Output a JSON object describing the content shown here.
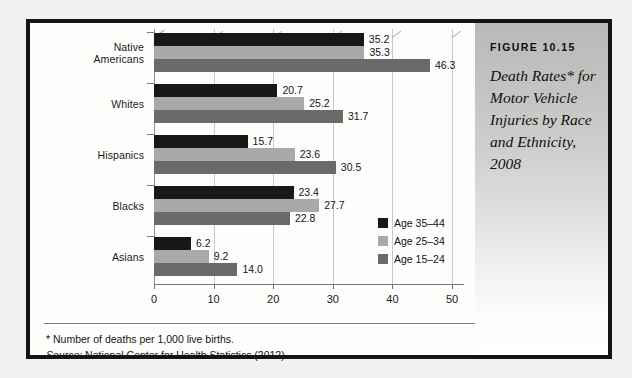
{
  "caption": {
    "figure_number": "FIGURE 10.15",
    "title": "Death Rates* for Motor Vehicle Injuries by Race and Ethnicity, 2008"
  },
  "footnote": {
    "asterisk_note": "*  Number of deaths per 1,000 live births.",
    "source_label": "Source:",
    "source_text": " National Center for Health Statistics (2012)."
  },
  "colors": {
    "series_35_44": "#181818",
    "series_25_34": "#a9a9a9",
    "series_15_24": "#6a6a6a",
    "frame": "#151515",
    "gridline": "#c9c9c9"
  },
  "chart_data": {
    "type": "bar",
    "orientation": "horizontal",
    "title": "Death Rates* for Motor Vehicle Injuries by Race and Ethnicity, 2008",
    "xlabel": "",
    "ylabel": "",
    "xlim": [
      0,
      52
    ],
    "xticks": [
      0,
      10,
      20,
      30,
      40,
      50
    ],
    "xtick_labels": [
      "0",
      "10",
      "20",
      "30",
      "40",
      "50"
    ],
    "grid": true,
    "legend_position": "center-right",
    "categories": [
      "Native Americans",
      "Whites",
      "Hispanics",
      "Blacks",
      "Asians"
    ],
    "category_lines": [
      [
        "Native",
        "Americans"
      ],
      [
        "Whites"
      ],
      [
        "Hispanics"
      ],
      [
        "Blacks"
      ],
      [
        "Asians"
      ]
    ],
    "series": [
      {
        "name": "Age 35–44",
        "color": "#181818",
        "values": [
          35.2,
          20.7,
          15.7,
          23.4,
          6.2
        ]
      },
      {
        "name": "Age 25–34",
        "color": "#a9a9a9",
        "values": [
          35.3,
          25.2,
          23.6,
          27.7,
          9.2
        ]
      },
      {
        "name": "Age 15–24",
        "color": "#6a6a6a",
        "values": [
          46.3,
          31.7,
          30.5,
          22.8,
          14.0
        ]
      }
    ],
    "value_labels": [
      [
        "35.2",
        "35.3",
        "46.3"
      ],
      [
        "20.7",
        "25.2",
        "31.7"
      ],
      [
        "15.7",
        "23.6",
        "30.5"
      ],
      [
        "23.4",
        "27.7",
        "22.8"
      ],
      [
        "6.2",
        "9.2",
        "14.0"
      ]
    ]
  }
}
